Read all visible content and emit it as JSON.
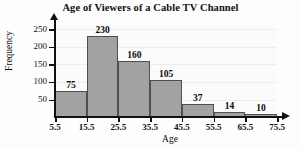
{
  "chart_data": {
    "type": "bar",
    "title": "Age of Viewers of a Cable TV Channel",
    "xlabel": "Age",
    "ylabel": "Frequency",
    "categories": [
      "5.5-15.5",
      "15.5-25.5",
      "25.5-35.5",
      "35.5-45.5",
      "45.5-55.5",
      "55.5-65.5",
      "65.5-75.5"
    ],
    "bin_edges": [
      "5.5",
      "15.5",
      "25.5",
      "35.5",
      "45.5",
      "55.5",
      "65.5",
      "75.5"
    ],
    "values": [
      75,
      230,
      160,
      105,
      37,
      14,
      10
    ],
    "value_labels": [
      "75",
      "230",
      "160",
      "105",
      "37",
      "14",
      "10"
    ],
    "xticks": [
      "5.5",
      "15.5",
      "25.5",
      "35.5",
      "45.5",
      "55.5",
      "65.5",
      "75.5"
    ],
    "yticks": [
      "50",
      "100",
      "150",
      "200",
      "250"
    ],
    "ytick_values": [
      50,
      100,
      150,
      200,
      250
    ],
    "ylim": [
      0,
      265
    ],
    "xlim": [
      5.5,
      75.5
    ],
    "grid": true,
    "legend": false,
    "bar_color": "#a2a2a2",
    "bar_border_color": "#4f4f4f",
    "axis_color": "#111111",
    "grid_color": "#ececec",
    "text_color": "#101010"
  }
}
